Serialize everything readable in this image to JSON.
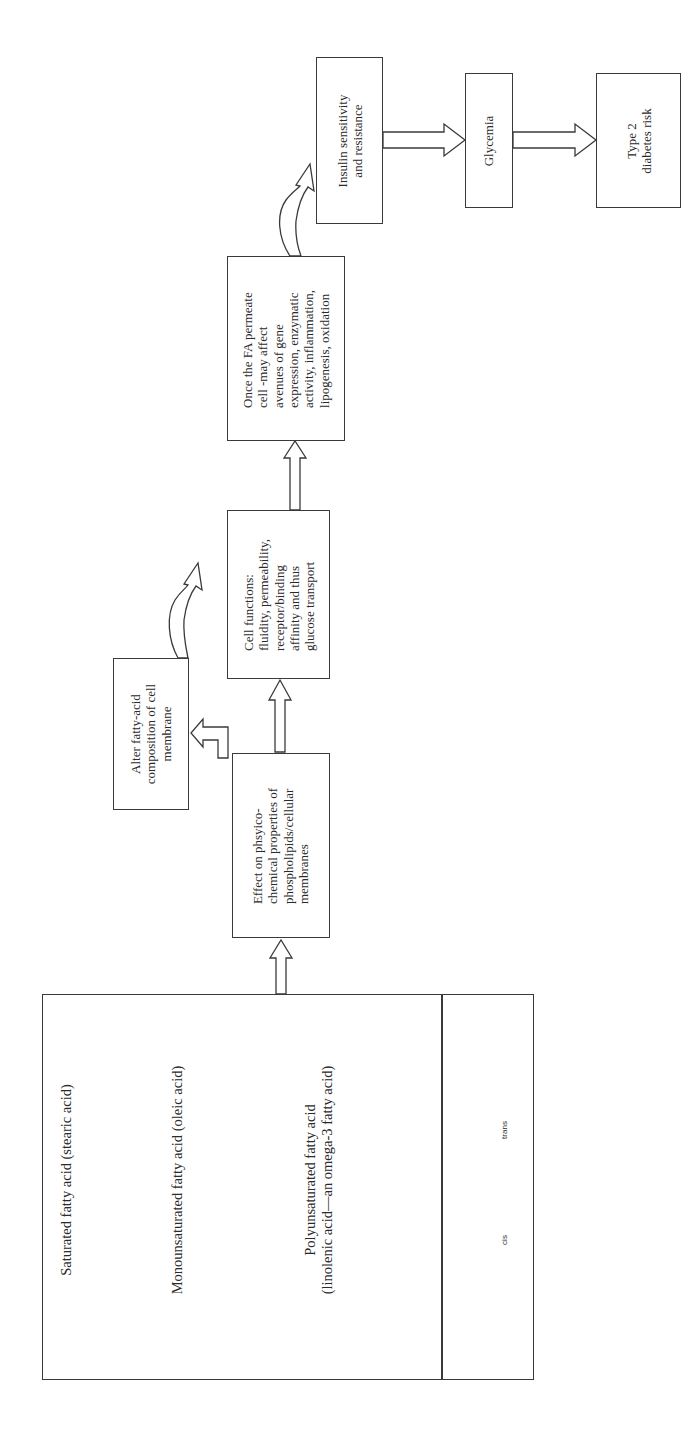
{
  "diagram": {
    "source_box": {
      "sections": [
        {
          "title": "Saturated fatty acid (stearic acid)",
          "structure": "H–C–C–C–C–C–C–C–C–C–C–C–C–C–C–C–C–C–C(=O)OH, all carbons saturated with H"
        },
        {
          "title": "Monounsaturated fatty acid (oleic acid)",
          "structure": "H–C–C–C–C–C–C–C–C–C=C–C–C–C–C–C–C–C(=O)OH, kinked at C=C"
        },
        {
          "title_line1": "Polyunsaturated fatty acid",
          "title_line2": "(linolenic acid—an omega-3 fatty acid)",
          "structure": "chain with multiple C=C double bonds ending in C(=O)OH"
        }
      ],
      "isomers": [
        {
          "label": "cis",
          "formula": "H–C=C–H (same side)"
        },
        {
          "label": "trans",
          "formula": "H–C=C–H (opposite sides)"
        }
      ]
    },
    "boxes": {
      "effect": {
        "lines": [
          "Effect on phsyico-",
          "chemical properties of",
          "phospholipids/cellular",
          "membranes"
        ]
      },
      "alter": {
        "lines": [
          "Alter fatty-acid",
          "composition of cell",
          "membrane"
        ]
      },
      "cell_functions": {
        "lines": [
          "Cell functions:",
          "fluidity, permeability,",
          "receptor/binding",
          "affinity and thus",
          "glucose transport"
        ]
      },
      "once_fa": {
        "lines": [
          "Once the FA permeate",
          "cell -may affect",
          "avenues of gene",
          "expression, enzymatic",
          "activity, inflammation,",
          "lipogenesis, oxidation"
        ]
      },
      "insulin": {
        "lines": [
          "Insulin sensitivity",
          "and resistance"
        ]
      },
      "glycemia": {
        "lines": [
          "Glycemia"
        ]
      },
      "type2": {
        "lines": [
          "Type 2",
          "diabetes risk"
        ]
      }
    },
    "mol_text": {
      "sat_title": "Saturated fatty acid (stearic acid)",
      "mono_title": "Monounsaturated fatty acid (oleic acid)",
      "poly_title1": "Polyunsaturated fatty acid",
      "poly_title2": "(linolenic acid—an omega-3 fatty acid)",
      "cis": "cis",
      "trans": "trans",
      "O": "O",
      "OH": "OH",
      "H": "H",
      "C": "C"
    },
    "arrows": [
      {
        "from": "source_box",
        "to": "effect",
        "style": "hollow-block"
      },
      {
        "from": "effect",
        "to": "alter",
        "style": "hollow-L"
      },
      {
        "from": "effect",
        "to": "cell_functions",
        "style": "hollow-block"
      },
      {
        "from": "alter",
        "to": "cell_functions",
        "style": "hollow-curved"
      },
      {
        "from": "cell_functions",
        "to": "once_fa",
        "style": "hollow-block"
      },
      {
        "from": "once_fa",
        "to": "insulin",
        "style": "hollow-curved"
      },
      {
        "from": "insulin",
        "to": "glycemia",
        "style": "hollow-block"
      },
      {
        "from": "glycemia",
        "to": "type2",
        "style": "hollow-block"
      }
    ],
    "colors": {
      "stroke": "#3a3a3a",
      "text": "#2a2a2a",
      "background": "#ffffff"
    }
  }
}
